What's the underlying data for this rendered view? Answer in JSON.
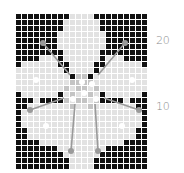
{
  "chart": {
    "title": "",
    "type": "knitting-chart",
    "columns": 22,
    "rows": 26,
    "origin": [
      16,
      14
    ],
    "cell_pitch": 6,
    "cell_size": 5,
    "colors": {
      "background": "#ffffff",
      "light": "#e2e2e2",
      "dark": "#111111",
      "mid": "#c4c4c4",
      "line": "#9a9a9a",
      "highlight_dot": "#ffffff"
    },
    "legend": {
      "0": "light stitch",
      "1": "dark stitch",
      "2": "mid-gray stitch"
    },
    "left_half_rows": [
      "11111111100",
      "11111111000",
      "11111111000",
      "11111110000",
      "11111110000",
      "11111110000",
      "11111111000",
      "11110001000",
      "10000001100",
      "00000000100",
      "00000000012",
      "00000000022",
      "00000000202",
      "10000001020",
      "11101111202",
      "11000000020",
      "10000000000",
      "10000000000",
      "10000000000",
      "11000000000",
      "11000000000",
      "11110000000",
      "11111110000",
      "11111111000",
      "11111111100",
      "11111111100"
    ],
    "row_labels": [
      {
        "text": "20",
        "y": 41
      },
      {
        "text": "10",
        "y": 107
      }
    ],
    "stem_lines": [
      {
        "x1": 43,
        "y1": 43,
        "x2": 70,
        "y2": 75
      },
      {
        "x1": 125,
        "y1": 43,
        "x2": 98,
        "y2": 75
      },
      {
        "x1": 30,
        "y1": 110,
        "x2": 64,
        "y2": 98
      },
      {
        "x1": 139,
        "y1": 110,
        "x2": 104,
        "y2": 98
      },
      {
        "x1": 71,
        "y1": 151,
        "x2": 75,
        "y2": 104
      },
      {
        "x1": 98,
        "y1": 151,
        "x2": 95,
        "y2": 104
      }
    ],
    "stem_end_dots": [
      {
        "x": 43,
        "y": 43
      },
      {
        "x": 125,
        "y": 43
      },
      {
        "x": 30,
        "y": 110
      },
      {
        "x": 139,
        "y": 110
      },
      {
        "x": 71,
        "y": 151
      },
      {
        "x": 98,
        "y": 151
      }
    ],
    "white_dots": [
      {
        "x": 36,
        "y": 80
      },
      {
        "x": 132,
        "y": 80
      },
      {
        "x": 82,
        "y": 82
      },
      {
        "x": 92,
        "y": 84
      },
      {
        "x": 84,
        "y": 93
      },
      {
        "x": 73,
        "y": 99
      },
      {
        "x": 96,
        "y": 99
      },
      {
        "x": 46,
        "y": 126
      },
      {
        "x": 122,
        "y": 126
      }
    ]
  }
}
